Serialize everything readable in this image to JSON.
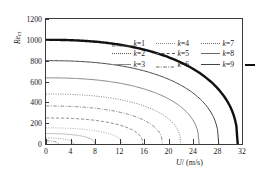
{
  "chart_data": {
    "type": "line",
    "title": "",
    "xlabel": "U/ (m/s)",
    "ylabel": "Recr",
    "ylabel_base": "Re",
    "ylabel_sub": "cr",
    "xlim": [
      0,
      32
    ],
    "ylim": [
      0,
      1200
    ],
    "xticks": [
      0,
      4,
      8,
      12,
      16,
      20,
      24,
      28,
      32
    ],
    "yticks": [
      0,
      200,
      400,
      600,
      800,
      1000,
      1200
    ],
    "grid": false,
    "legend_position": "top-right-inside",
    "series": [
      {
        "name": "k=1",
        "legend_label": "k = 1",
        "y_intercept": 30,
        "x_intercept": 2.0,
        "style": "dashdot",
        "width": 0.7,
        "color": "#555555"
      },
      {
        "name": "k=2",
        "legend_label": "k = 2",
        "y_intercept": 58,
        "x_intercept": 4.5,
        "style": "dotted",
        "width": 0.7,
        "color": "#555555"
      },
      {
        "name": "k=3",
        "legend_label": "k = 3",
        "y_intercept": 100,
        "x_intercept": 8.0,
        "style": "solid-thin",
        "width": 0.6,
        "color": "#8a8a8a"
      },
      {
        "name": "k=4",
        "legend_label": "k = 4",
        "y_intercept": 155,
        "x_intercept": 12.4,
        "style": "dotted",
        "width": 0.8,
        "color": "#888888"
      },
      {
        "name": "k=5",
        "legend_label": "k = 5",
        "y_intercept": 250,
        "x_intercept": 15.8,
        "style": "dashed",
        "width": 0.7,
        "color": "#555555"
      },
      {
        "name": "k=6",
        "legend_label": "k = 6",
        "y_intercept": 365,
        "x_intercept": 19.0,
        "style": "dashdot",
        "width": 0.7,
        "color": "#555555"
      },
      {
        "name": "k=7",
        "legend_label": "k = 7",
        "y_intercept": 480,
        "x_intercept": 22.0,
        "style": "dotted",
        "width": 0.9,
        "color": "#666666"
      },
      {
        "name": "k=8",
        "legend_label": "k = 8",
        "y_intercept": 635,
        "x_intercept": 25.0,
        "style": "solid-thin",
        "width": 0.8,
        "color": "#6a6a6a"
      },
      {
        "name": "k=9",
        "legend_label": "k = 9",
        "y_intercept": 800,
        "x_intercept": 28.2,
        "style": "solid",
        "width": 1.0,
        "color": "#444444"
      },
      {
        "name": "k=10",
        "legend_label": "k = 10",
        "y_intercept": 1000,
        "x_intercept": 31.3,
        "style": "solid-thick",
        "width": 2.4,
        "color": "#111111"
      }
    ],
    "legend_columns": [
      [
        "k=1",
        "k=2",
        "k=3"
      ],
      [
        "k=4",
        "k=5",
        "k=6"
      ],
      [
        "k=7",
        "k=8",
        "k=9"
      ],
      [
        "k=10"
      ]
    ]
  }
}
